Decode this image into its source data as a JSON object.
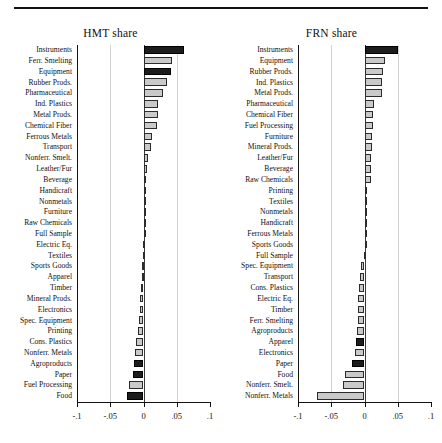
{
  "figure": {
    "top_rule": true,
    "axis": {
      "min": -0.1,
      "max": 0.1,
      "ticks": [
        -0.1,
        -0.05,
        0,
        0.05,
        0.1
      ],
      "tick_labels": [
        "-.1",
        "-.05",
        "0",
        ".05",
        ".1"
      ],
      "gridlines": [
        -0.05,
        0.05
      ],
      "zero_at": 0
    },
    "colors": {
      "bar_light": "#c9c9c9",
      "bar_dark": "#1c1c1c",
      "bar_edge": "#2b2b2b",
      "grid": "#d2d2d2",
      "axis": "#111111",
      "text": "#111111",
      "background": "#ffffff"
    }
  },
  "chart_data": [
    {
      "type": "bar",
      "orientation": "horizontal",
      "title": "HMT share",
      "xlabel": "",
      "ylabel": "",
      "xlim": [
        -0.1,
        0.1
      ],
      "xticks": [
        -0.1,
        -0.05,
        0,
        0.05,
        0.1
      ],
      "xtick_labels": [
        "-.1",
        "-.05",
        "0",
        ".05",
        ".1"
      ],
      "grid": true,
      "legend": "none",
      "categories": [
        "Instruments",
        "Ferr. Smelting",
        "Equipment",
        "Rubber Prods.",
        "Pharmaceutical",
        "Ind. Plastics",
        "Metal Prods.",
        "Chemical Fiber",
        "Ferrous Metals",
        "Transport",
        "Nonferr. Smelt.",
        "Leather/Fur",
        "Beverage",
        "Handicraft",
        "Nonmetals",
        "Furniture",
        "Raw Chemicals",
        "Full Sample",
        "Electric Eq.",
        "Textiles",
        "Sports Goods",
        "Apparel",
        "Timber",
        "Mineral Prods.",
        "Electronics",
        "Spec. Equipment",
        "Printing",
        "Cons. Plastics",
        "Nonferr. Metals",
        "Agroproducts",
        "Paper",
        "Fuel Processing",
        "Food"
      ],
      "values": [
        0.0605,
        0.0425,
        0.0415,
        0.0355,
        0.029,
        0.0215,
        0.0215,
        0.021,
        0.013,
        0.011,
        0.0062,
        0.0052,
        0.003,
        0.0022,
        0.0016,
        0.001,
        0.0006,
        0.0002,
        -0.001,
        -0.0014,
        -0.0022,
        -0.0028,
        -0.004,
        -0.0046,
        -0.005,
        -0.0068,
        -0.0082,
        -0.0118,
        -0.0125,
        -0.015,
        -0.0155,
        -0.0215,
        -0.025
      ],
      "significant": [
        true,
        false,
        true,
        false,
        false,
        false,
        false,
        false,
        false,
        false,
        false,
        false,
        false,
        false,
        false,
        false,
        false,
        false,
        false,
        false,
        false,
        false,
        false,
        false,
        false,
        false,
        false,
        false,
        false,
        true,
        true,
        false,
        true
      ]
    },
    {
      "type": "bar",
      "orientation": "horizontal",
      "title": "FRN share",
      "xlabel": "",
      "ylabel": "",
      "xlim": [
        -0.1,
        0.1
      ],
      "xticks": [
        -0.1,
        -0.05,
        0,
        0.05,
        0.1
      ],
      "xtick_labels": [
        "-.1",
        "-.05",
        "0",
        ".05",
        ".1"
      ],
      "grid": true,
      "legend": "none",
      "categories": [
        "Instruments",
        "Equipment",
        "Rubber Prods.",
        "Ind. Plastics",
        "Metal Prods.",
        "Pharmaceutical",
        "Chemical Fiber",
        "Fuel Processing",
        "Furniture",
        "Mineral Prods.",
        "Leather/Fur",
        "Beverage",
        "Raw Chemicals",
        "Printing",
        "Textiles",
        "Nonmetals",
        "Handicraft",
        "Ferrous Metals",
        "Sports Goods",
        "Full Sample",
        "Spec. Equipment",
        "Transport",
        "Cons. Plastics",
        "Electric Eq.",
        "Timber",
        "Ferr. Smelting",
        "Agroproducts",
        "Apparel",
        "Electronics",
        "Paper",
        "Food",
        "Nonferr. Smelt.",
        "Nonferr. Metals"
      ],
      "values": [
        0.05,
        0.031,
        0.0275,
        0.027,
        0.026,
        0.0145,
        0.0135,
        0.0125,
        0.012,
        0.0115,
        0.0105,
        0.01,
        0.0098,
        0.0032,
        0.0022,
        0.0018,
        0.0014,
        0.001,
        0.0006,
        -0.001,
        -0.006,
        -0.0075,
        -0.009,
        -0.0095,
        -0.01,
        -0.0105,
        -0.012,
        -0.0135,
        -0.015,
        -0.019,
        -0.029,
        -0.033,
        -0.072
      ],
      "significant": [
        true,
        false,
        false,
        false,
        false,
        false,
        false,
        false,
        false,
        false,
        false,
        false,
        false,
        false,
        false,
        false,
        false,
        false,
        false,
        false,
        false,
        false,
        false,
        false,
        false,
        false,
        false,
        true,
        false,
        true,
        false,
        false,
        false
      ]
    }
  ]
}
